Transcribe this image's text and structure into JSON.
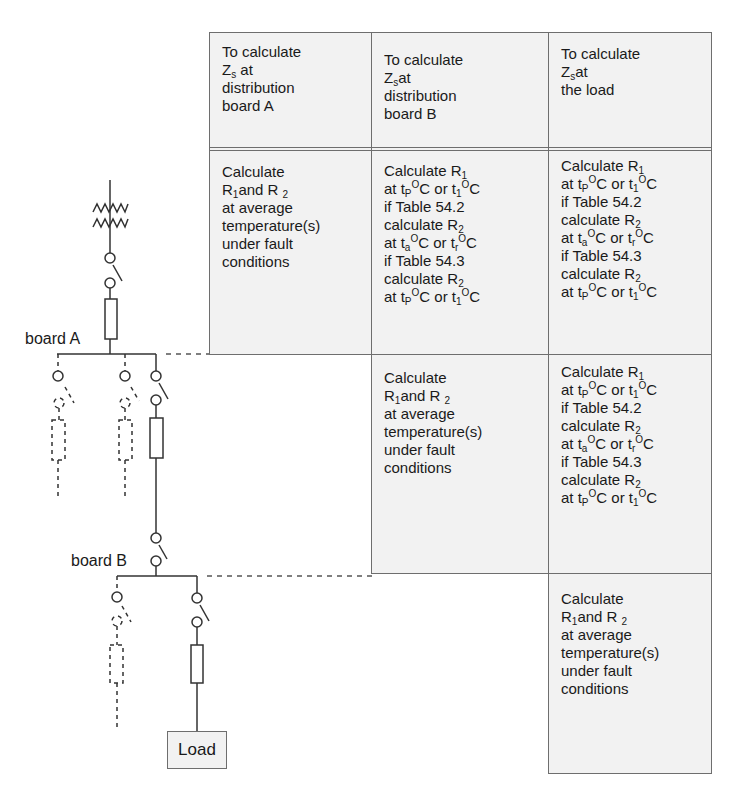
{
  "header": {
    "col_a": {
      "line1": "To calculate",
      "z": "Z",
      "z_sub": "s",
      "z_after": " at",
      "line3": "distribution",
      "line4": "board A"
    },
    "col_b": {
      "line1": "To calculate",
      "z": "Z",
      "z_sub": "s",
      "z_after": "at",
      "line3": "distribution",
      "line4": "board B"
    },
    "col_c": {
      "line1": "To calculate",
      "z": "Z",
      "z_sub": "s",
      "z_after": "at",
      "line3": "the load"
    }
  },
  "avg_block": {
    "line1": "Calculate",
    "r1": "R",
    "r1_sub": "1",
    "and": "and R ",
    "r2_sub": "2",
    "line3": "at average",
    "line4": "temperature(s)",
    "line5": "under fault",
    "line6": "conditions"
  },
  "table_block": {
    "l1": "Calculate R",
    "l1_sub": "1",
    "l2_a": "at t",
    "l2_sub1": "P",
    "l2_sup1": "O",
    "l2_b": "C or t",
    "l2_sub2": "1",
    "l2_sup2": "O",
    "l2_c": "C",
    "l3": "if Table 54.2",
    "l4": "calculate R",
    "l4_sub": "2",
    "l5_a": "at t",
    "l5_sub1": "a",
    "l5_sup1": "O",
    "l5_b": "C or t",
    "l5_sub2": "r",
    "l5_sup2": "O",
    "l5_c": "C",
    "l6": "if Table 54.3",
    "l7": "calculate R",
    "l7_sub": "2",
    "l8_a": "at t",
    "l8_sub1": "P",
    "l8_sup1": "O",
    "l8_b": "C or t",
    "l8_sub2": "1",
    "l8_sup2": "O",
    "l8_c": "C"
  },
  "diagram": {
    "board_a_label": "board A",
    "board_b_label": "board B",
    "load_label": "Load"
  },
  "colors": {
    "cell_fill": "#f2f2f2",
    "line": "#6e6e6e",
    "text": "#1a1a1a"
  }
}
